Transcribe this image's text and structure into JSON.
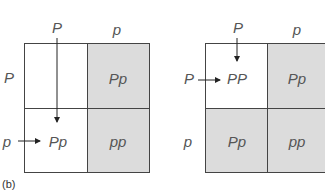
{
  "caption": "(b)",
  "left_square": {
    "col_headers": [
      "P",
      "p"
    ],
    "row_headers": [
      "P",
      "p"
    ],
    "cells": [
      {
        "row": 0,
        "col": 0,
        "text": "",
        "shaded": false
      },
      {
        "row": 0,
        "col": 1,
        "text": "Pp",
        "shaded": true
      },
      {
        "row": 1,
        "col": 0,
        "text": "Pp",
        "shaded": false
      },
      {
        "row": 1,
        "col": 1,
        "text": "pp",
        "shaded": true
      }
    ],
    "c00": "",
    "c01": "Pp",
    "c10": "Pp",
    "c11": "pp"
  },
  "right_square": {
    "col_headers": [
      "P",
      "p"
    ],
    "row_headers": [
      "P",
      "p"
    ],
    "cells": [
      {
        "row": 0,
        "col": 0,
        "text": "PP",
        "shaded": false
      },
      {
        "row": 0,
        "col": 1,
        "text": "Pp",
        "shaded": true
      },
      {
        "row": 1,
        "col": 0,
        "text": "Pp",
        "shaded": true
      },
      {
        "row": 1,
        "col": 1,
        "text": "pp",
        "shaded": true
      }
    ],
    "c00": "PP",
    "c01": "Pp",
    "c10": "Pp",
    "c11": "pp"
  },
  "colors": {
    "shade": "#dcdcdc",
    "line": "#444444",
    "text": "#555555"
  }
}
